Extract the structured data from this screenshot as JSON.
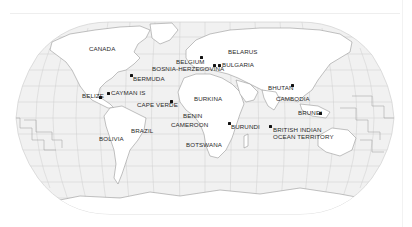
{
  "map": {
    "projection": "robinson",
    "colors": {
      "ocean": "#f1f1f1",
      "land": "#ffffff",
      "borders": "#9a9a9a",
      "graticule": "#c8c8c8",
      "marker": "#111111",
      "label": "#2a2a2a"
    },
    "labels": [
      {
        "id": "canada",
        "text": "CANADA",
        "x": 89,
        "y": 49,
        "marker": null
      },
      {
        "id": "bermuda",
        "text": "BERMUDA",
        "x": 133,
        "y": 75,
        "marker": {
          "x": 131,
          "y": 75
        }
      },
      {
        "id": "belize",
        "text": "BELIZE",
        "x": 81,
        "y": 94,
        "marker": {
          "x": 100,
          "y": 97
        }
      },
      {
        "id": "cayman-is",
        "text": "CAYMAN IS",
        "x": 110,
        "y": 91,
        "marker": {
          "x": 108,
          "y": 93
        }
      },
      {
        "id": "cape-verde",
        "text": "CAPE VERDE",
        "x": 137,
        "y": 104,
        "marker": {
          "x": 171,
          "y": 101
        }
      },
      {
        "id": "belgium",
        "text": "BELGIUM",
        "x": 176,
        "y": 59,
        "marker": {
          "x": 200,
          "y": 57
        }
      },
      {
        "id": "bosnia-herzegovina",
        "text": "BOSNIA-HERZEGOVINA",
        "x": 152,
        "y": 66,
        "marker": {
          "x": 213,
          "y": 65
        }
      },
      {
        "id": "belarus",
        "text": "BELARUS",
        "x": 228,
        "y": 50,
        "marker": null
      },
      {
        "id": "bulgaria",
        "text": "BULGARIA",
        "x": 221,
        "y": 62,
        "marker": {
          "x": 218,
          "y": 65
        }
      },
      {
        "id": "burkina",
        "text": "BURKINA",
        "x": 194,
        "y": 93,
        "marker": null
      },
      {
        "id": "benin",
        "text": "BENIN",
        "x": 183,
        "y": 113,
        "marker": null
      },
      {
        "id": "cameroon",
        "text": "CAMEROON",
        "x": 170,
        "y": 122,
        "marker": null
      },
      {
        "id": "burundi",
        "text": "BURUNDI",
        "x": 231,
        "y": 124,
        "marker": {
          "x": 228,
          "y": 123
        }
      },
      {
        "id": "botswana",
        "text": "BOTSWANA",
        "x": 186,
        "y": 142,
        "marker": null
      },
      {
        "id": "british-indian-ocean-territory",
        "text": "BRITISH INDIAN\nOCEAN TERRITORY",
        "x": 273,
        "y": 127,
        "marker": {
          "x": 270,
          "y": 126
        }
      },
      {
        "id": "bhutan",
        "text": "BHUTAN",
        "x": 268,
        "y": 86,
        "marker": {
          "x": 292,
          "y": 86
        }
      },
      {
        "id": "cambodia",
        "text": "CAMBODIA",
        "x": 276,
        "y": 95,
        "marker": null
      },
      {
        "id": "brunei",
        "text": "BRUNEI",
        "x": 298,
        "y": 109,
        "marker": {
          "x": 320,
          "y": 113
        }
      },
      {
        "id": "brazil",
        "text": "BRAZIL",
        "x": 131,
        "y": 127,
        "marker": null
      },
      {
        "id": "bolivia",
        "text": "BOLIVIA",
        "x": 99,
        "y": 134,
        "marker": null
      }
    ]
  }
}
